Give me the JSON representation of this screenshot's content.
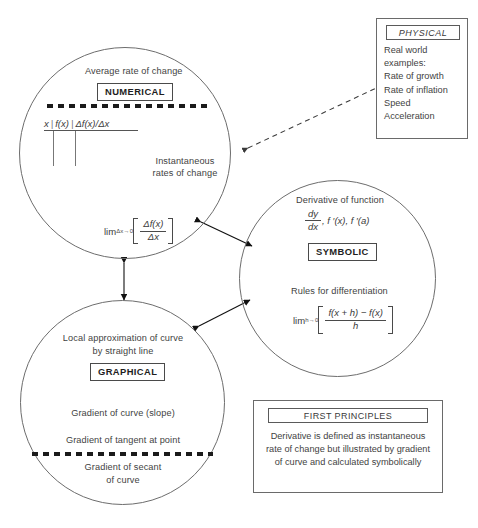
{
  "diagram": {
    "accent_color": "#1b1b1b",
    "line_color": "#6d6d6d"
  },
  "numerical": {
    "heading": "Average rate of change",
    "keyword": "NUMERICAL",
    "table": {
      "columns": [
        "x",
        "f(x)",
        "Δf(x)/Δx"
      ]
    },
    "subheading_line1": "Instantaneous",
    "subheading_line2": "rates of change",
    "limit": {
      "lim": "lim",
      "subscript": "Δx→0",
      "numerator": "Δf(x)",
      "denominator": "Δx"
    }
  },
  "symbolic": {
    "heading": "Derivative of function",
    "notation": {
      "numerator": "dy",
      "denominator": "dx",
      "rest": ", f ′(x), f ′(a)"
    },
    "keyword": "SYMBOLIC",
    "subheading": "Rules for differentiation",
    "limit": {
      "lim": "lim",
      "subscript": "h→0",
      "numerator": "f(x + h) − f(x)",
      "denominator": "h"
    }
  },
  "graphical": {
    "heading_line1": "Local approximation of curve",
    "heading_line2": "by straight line",
    "keyword": "GRAPHICAL",
    "item1": "Gradient of curve (slope)",
    "item2": "Gradient of tangent at point",
    "item3_line1": "Gradient of secant",
    "item3_line2": "of curve"
  },
  "physical": {
    "keyword": "PHYSICAL",
    "items": [
      "Real world",
      "examples:",
      "Rate of growth",
      "Rate of inflation",
      "Speed",
      "Acceleration"
    ]
  },
  "first_principles": {
    "keyword": "FIRST PRINCIPLES",
    "body": "Derivative is defined as instantaneous rate of change but illustrated by gradient of curve and calculated symbolically"
  }
}
